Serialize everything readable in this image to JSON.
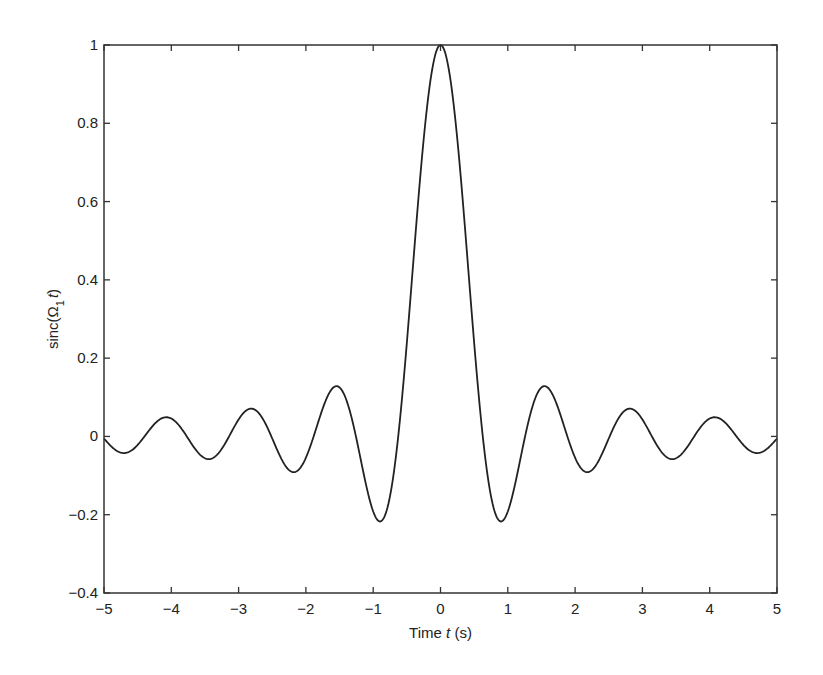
{
  "chart_data": {
    "type": "line",
    "title": "",
    "xlabel": "Time t (s)",
    "xlabel_parts": {
      "pre": "Time ",
      "italic": "t",
      "post": " (s)"
    },
    "ylabel": "sinc(Ω1 t)",
    "ylabel_parts": {
      "pre": "sinc(Ω",
      "sub": "1",
      "italic": "t",
      "post": ")"
    },
    "xlim": [
      -5,
      5
    ],
    "ylim": [
      -0.4,
      1
    ],
    "grid": false,
    "legend": null,
    "xticks": [
      -5,
      -4,
      -3,
      -2,
      -1,
      0,
      1,
      2,
      3,
      4,
      5
    ],
    "xtick_labels": [
      "−5",
      "−4",
      "−3",
      "−2",
      "−1",
      "0",
      "1",
      "2",
      "3",
      "4",
      "5"
    ],
    "yticks": [
      -0.4,
      -0.2,
      0,
      0.2,
      0.4,
      0.6,
      0.8,
      1
    ],
    "ytick_labels": [
      "−0.4",
      "−0.2",
      "0",
      "0.2",
      "0.4",
      "0.6",
      "0.8",
      "1"
    ],
    "function": "sin(Ω1 t)/(Ω1 t), Ω1 = 5 rad/s",
    "omega": 5,
    "color": "#222222",
    "series": [
      {
        "name": "sinc(Ω1 t)",
        "x": [
          -5,
          -4.75,
          -4.5,
          -4.25,
          -4,
          -3.75,
          -3.5,
          -3.25,
          -3,
          -2.75,
          -2.5,
          -2.25,
          -2,
          -1.75,
          -1.5,
          -1.25,
          -1,
          -0.9,
          -0.75,
          -0.5,
          -0.25,
          0,
          0.25,
          0.5,
          0.75,
          0.9,
          1,
          1.25,
          1.5,
          1.75,
          2,
          2.25,
          2.5,
          2.75,
          3,
          3.25,
          3.5,
          3.75,
          4,
          4.25,
          4.5,
          4.75,
          5
        ],
        "y": [
          -0.026,
          -0.041,
          -0.001,
          0.044,
          0.046,
          0.001,
          -0.056,
          -0.038,
          0.043,
          0.068,
          -0.005,
          -0.087,
          -0.054,
          0.072,
          0.125,
          0.0,
          -0.192,
          -0.217,
          -0.151,
          0.239,
          0.759,
          1.0,
          0.759,
          0.239,
          -0.151,
          -0.217,
          -0.192,
          0.0,
          0.125,
          0.072,
          -0.054,
          -0.087,
          -0.005,
          0.068,
          0.043,
          -0.038,
          -0.056,
          0.001,
          0.046,
          0.044,
          -0.001,
          -0.041,
          -0.026
        ]
      }
    ]
  }
}
